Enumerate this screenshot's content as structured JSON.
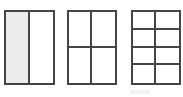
{
  "figure": {
    "stroke_color": "#444444",
    "shade_color": "#ececec",
    "shapes": [
      {
        "id": "halves",
        "x": 4,
        "y": 10,
        "width": 51,
        "height": 75,
        "cols": 2,
        "rows": 1,
        "shaded_cells": [
          0
        ]
      },
      {
        "id": "fourths",
        "x": 67,
        "y": 10,
        "width": 50,
        "height": 75,
        "cols": 2,
        "rows": 2,
        "shaded_cells": []
      },
      {
        "id": "eighths",
        "x": 131,
        "y": 10,
        "width": 50,
        "height": 75,
        "cols": 2,
        "rows": 4,
        "shaded_cells": []
      }
    ]
  }
}
